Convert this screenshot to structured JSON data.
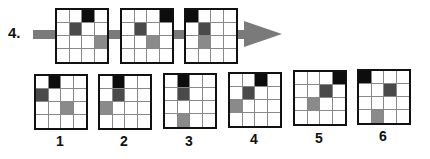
{
  "question": {
    "number_label": "4.",
    "sequence": [
      {
        "black": [
          0,
          2
        ],
        "dark": [
          1,
          1
        ],
        "mid": [
          2,
          3
        ]
      },
      {
        "black": [
          0,
          3
        ],
        "dark": [
          1,
          1
        ],
        "mid": [
          2,
          2
        ]
      },
      {
        "black": [
          0,
          0
        ],
        "dark": [
          1,
          1
        ],
        "mid": [
          2,
          1
        ]
      }
    ]
  },
  "options": [
    {
      "label": "1",
      "black": [
        0,
        1
      ],
      "dark": [
        1,
        0
      ],
      "mid": [
        2,
        2
      ]
    },
    {
      "label": "2",
      "black": [
        0,
        1
      ],
      "dark": [
        1,
        1
      ],
      "mid": [
        2,
        0
      ]
    },
    {
      "label": "3",
      "black": [
        0,
        1
      ],
      "dark": [
        1,
        1
      ],
      "mid": [
        3,
        1
      ]
    },
    {
      "label": "4",
      "black": [
        0,
        2
      ],
      "dark": [
        1,
        1
      ],
      "mid": [
        2,
        0
      ]
    },
    {
      "label": "5",
      "black": [
        0,
        3
      ],
      "dark": [
        1,
        2
      ],
      "mid": [
        2,
        1
      ]
    },
    {
      "label": "6",
      "black": [
        0,
        0
      ],
      "dark": [
        1,
        2
      ],
      "mid": [
        3,
        1
      ]
    }
  ],
  "colors": {
    "black": "#0d0d0d",
    "dark_gray": "#4a4a4a",
    "medium_gray": "#8a8a8a",
    "arrow": "#7a7a7a"
  }
}
